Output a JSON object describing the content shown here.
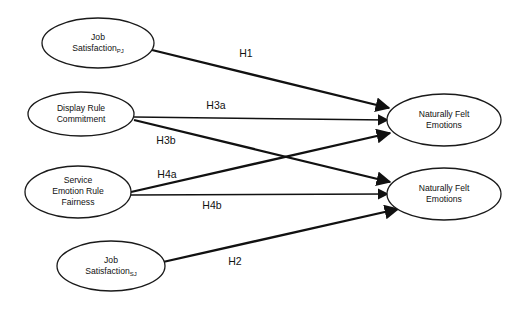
{
  "diagram": {
    "canvas": {
      "width": 513,
      "height": 309,
      "background": "#ffffff"
    },
    "stroke_color": "#111111",
    "nodes": [
      {
        "id": "job-satisfaction-pj",
        "label_line1": "Job",
        "label_line2": "Satisfaction",
        "label_subscript": "PJ",
        "cx": 98,
        "cy": 43,
        "rx": 56,
        "ry": 25
      },
      {
        "id": "display-rule-commitment",
        "label_line1": "Display Rule",
        "label_line2": "Commitment",
        "label_subscript": "",
        "cx": 81,
        "cy": 114,
        "rx": 53,
        "ry": 22
      },
      {
        "id": "service-emotion-rule-fairness",
        "label_line1": "Service",
        "label_line2": "Emotion Rule",
        "label_line3": "Fairness",
        "label_subscript": "",
        "cx": 78,
        "cy": 192,
        "rx": 53,
        "ry": 26
      },
      {
        "id": "job-satisfaction-sj",
        "label_line1": "Job",
        "label_line2": "Satisfaction",
        "label_subscript": "SJ",
        "cx": 111,
        "cy": 266,
        "rx": 54,
        "ry": 25
      },
      {
        "id": "naturally-felt-emotions-top",
        "label_line1": "Naturally Felt",
        "label_line2": "Emotions",
        "label_subscript": "",
        "cx": 444,
        "cy": 120,
        "rx": 57,
        "ry": 26
      },
      {
        "id": "naturally-felt-emotions-bottom",
        "label_line1": "Naturally Felt",
        "label_line2": "Emotions",
        "label_subscript": "",
        "cx": 444,
        "cy": 194,
        "rx": 57,
        "ry": 26
      }
    ],
    "paths": [
      {
        "id": "h1",
        "label": "H1",
        "from": "job-satisfaction-pj",
        "to": "naturally-felt-emotions-top",
        "x1": 152,
        "y1": 50,
        "x2": 389,
        "y2": 108,
        "weight": "thick",
        "label_x": 246,
        "label_y": 54
      },
      {
        "id": "h3a",
        "label": "H3a",
        "from": "display-rule-commitment",
        "to": "naturally-felt-emotions-top",
        "x1": 134,
        "y1": 117,
        "x2": 388,
        "y2": 120,
        "weight": "thin",
        "label_x": 216,
        "label_y": 106
      },
      {
        "id": "h3b",
        "label": "H3b",
        "from": "display-rule-commitment",
        "to": "naturally-felt-emotions-bottom",
        "x1": 134,
        "y1": 120,
        "x2": 390,
        "y2": 182,
        "weight": "thick",
        "label_x": 166,
        "label_y": 141
      },
      {
        "id": "h4a",
        "label": "H4a",
        "from": "service-emotion-rule-fairness",
        "to": "naturally-felt-emotions-top",
        "x1": 131,
        "y1": 192,
        "x2": 390,
        "y2": 133,
        "weight": "thick",
        "label_x": 167,
        "label_y": 175
      },
      {
        "id": "h4b",
        "label": "H4b",
        "from": "service-emotion-rule-fairness",
        "to": "naturally-felt-emotions-bottom",
        "x1": 131,
        "y1": 195,
        "x2": 388,
        "y2": 194,
        "weight": "thin",
        "label_x": 212,
        "label_y": 206
      },
      {
        "id": "h2",
        "label": "H2",
        "from": "job-satisfaction-sj",
        "to": "naturally-felt-emotions-bottom",
        "x1": 163,
        "y1": 262,
        "x2": 398,
        "y2": 209,
        "weight": "thick",
        "label_x": 235,
        "label_y": 262
      }
    ]
  }
}
